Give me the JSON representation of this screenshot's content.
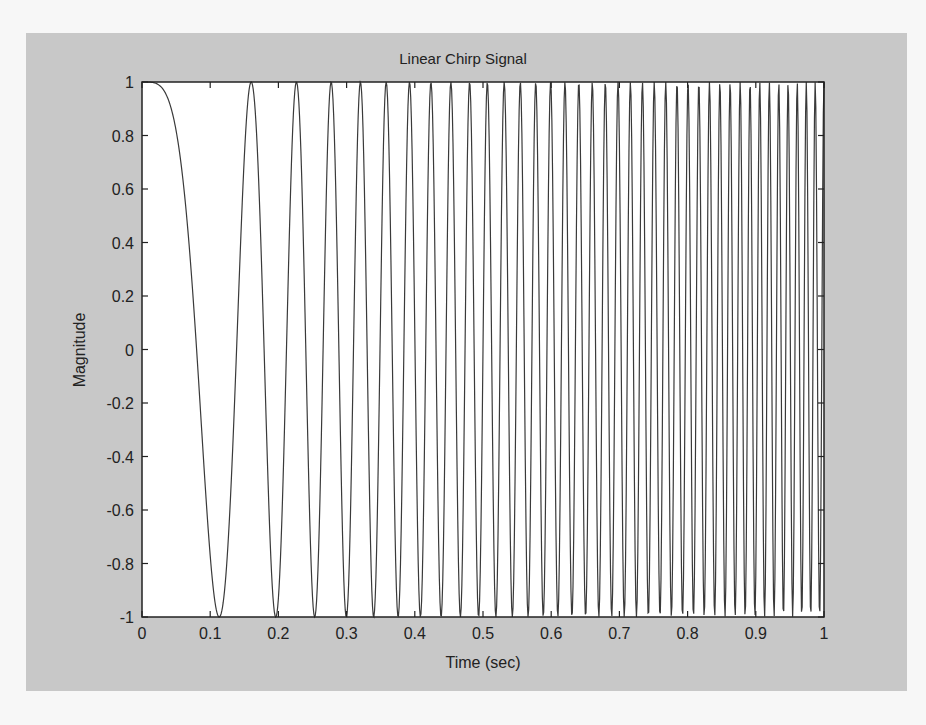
{
  "figure": {
    "title": "Linear Chirp Signal",
    "xlabel": "Time (sec)",
    "ylabel": "Magnitude",
    "colors": {
      "page": "#f7f7f7",
      "panel": "#c8c8c8",
      "axes_bg": "#ffffff",
      "line": "#3a3a3a",
      "axis": "#222222"
    }
  },
  "chart_data": {
    "type": "line",
    "title": "Linear Chirp Signal",
    "xlabel": "Time (sec)",
    "ylabel": "Magnitude",
    "xlim": [
      0,
      1
    ],
    "ylim": [
      -1,
      1
    ],
    "grid": false,
    "legend": null,
    "x_ticks": [
      "0",
      "0.1",
      "0.2",
      "0.3",
      "0.4",
      "0.5",
      "0.6",
      "0.7",
      "0.8",
      "0.9",
      "1"
    ],
    "y_ticks": [
      "1",
      "0.8",
      "0.6",
      "0.4",
      "0.2",
      "0",
      "-0.2",
      "-0.4",
      "-0.6",
      "-0.8",
      "-1"
    ],
    "series": [
      {
        "name": "chirp",
        "description": "Linear chirp cos(pi*k*t^2): starts at 1 at t=0, first minimum near t=0.08, frequency increases linearly to ~78 Hz at t=1",
        "start_frequency_hz": 0,
        "end_frequency_hz": 78,
        "amplitude": 1,
        "sample_count": 1000
      }
    ]
  }
}
